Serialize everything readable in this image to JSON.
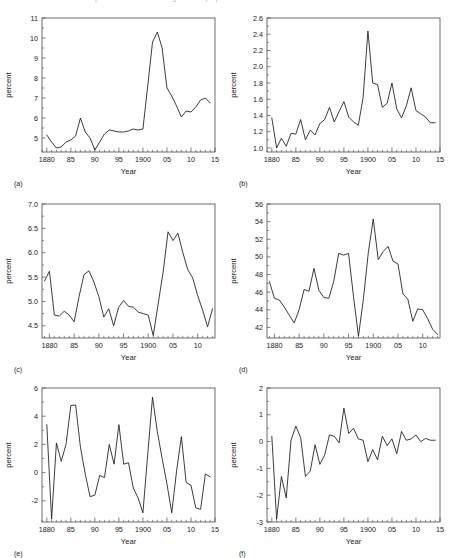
{
  "figure": {
    "width": 450,
    "height": 558,
    "background": "#ffffff",
    "line_color": "#1a1a1a",
    "axis_color": "#4a4a4a",
    "cutoff_top_text": "percent of the foreign-born population",
    "shared_xlabel": "Year",
    "shared_ylabel": "percent"
  },
  "chart_data": [
    {
      "type": "line",
      "panel": "(a)",
      "title": "",
      "xlabel": "Year",
      "ylabel": "percent",
      "xlim": [
        1879,
        1915
      ],
      "ylim": [
        4.3,
        11
      ],
      "yticks": [
        5,
        6,
        7,
        8,
        9,
        10,
        11
      ],
      "ytick_labels": [
        "5",
        "6",
        "7",
        "8",
        "9",
        "10",
        "11"
      ],
      "xticks": [
        1880,
        1885,
        1890,
        1895,
        1900,
        1905,
        1910,
        1915
      ],
      "xtick_labels": [
        "1880",
        "85",
        "90",
        "95",
        "1900",
        "05",
        "10",
        "15"
      ],
      "grid": false,
      "legend": "none",
      "x": [
        1880,
        1881,
        1882,
        1883,
        1884,
        1885,
        1886,
        1887,
        1888,
        1889,
        1890,
        1891,
        1892,
        1893,
        1894,
        1895,
        1896,
        1897,
        1898,
        1899,
        1900,
        1901,
        1902,
        1903,
        1904,
        1905,
        1906,
        1907,
        1908,
        1909,
        1910,
        1911,
        1912,
        1913,
        1914
      ],
      "values": [
        5.15,
        4.8,
        4.5,
        4.55,
        4.8,
        4.9,
        5.1,
        6.0,
        5.3,
        5.0,
        4.4,
        4.8,
        5.2,
        5.4,
        5.35,
        5.3,
        5.3,
        5.35,
        5.45,
        5.4,
        5.45,
        7.6,
        9.8,
        10.3,
        9.5,
        7.5,
        7.1,
        6.6,
        6.05,
        6.35,
        6.3,
        6.55,
        6.9,
        7.0,
        6.75
      ]
    },
    {
      "type": "line",
      "panel": "(b)",
      "title": "",
      "xlabel": "Year",
      "ylabel": "percent",
      "xlim": [
        1879,
        1915
      ],
      "ylim": [
        0.95,
        2.6
      ],
      "yticks": [
        1.0,
        1.2,
        1.4,
        1.6,
        1.8,
        2.0,
        2.2,
        2.4,
        2.6
      ],
      "ytick_labels": [
        "1.0",
        "1.2",
        "1.4",
        "1.6",
        "1.8",
        "2.0",
        "2.2",
        "2.4",
        "2.6"
      ],
      "xticks": [
        1880,
        1885,
        1890,
        1895,
        1900,
        1905,
        1910,
        1915
      ],
      "xtick_labels": [
        "1880",
        "85",
        "90",
        "95",
        "1900",
        "05",
        "10",
        "15"
      ],
      "grid": false,
      "legend": "none",
      "x": [
        1880,
        1881,
        1882,
        1883,
        1884,
        1885,
        1886,
        1887,
        1888,
        1889,
        1890,
        1891,
        1892,
        1893,
        1894,
        1895,
        1896,
        1897,
        1898,
        1899,
        1900,
        1901,
        1902,
        1903,
        1904,
        1905,
        1906,
        1907,
        1908,
        1909,
        1910,
        1911,
        1912,
        1913,
        1914
      ],
      "values": [
        1.37,
        1.0,
        1.12,
        1.02,
        1.18,
        1.17,
        1.35,
        1.1,
        1.22,
        1.16,
        1.3,
        1.35,
        1.5,
        1.32,
        1.45,
        1.57,
        1.38,
        1.32,
        1.28,
        1.62,
        2.44,
        1.8,
        1.78,
        1.5,
        1.55,
        1.8,
        1.48,
        1.37,
        1.52,
        1.74,
        1.46,
        1.42,
        1.38,
        1.31,
        1.31
      ]
    },
    {
      "type": "line",
      "panel": "(c)",
      "title": "",
      "xlabel": "Year",
      "ylabel": "percent",
      "xlim": [
        1878.5,
        1913.5
      ],
      "ylim": [
        4.25,
        7.0
      ],
      "yticks": [
        4.5,
        5.0,
        5.5,
        6.0,
        6.5,
        7.0
      ],
      "ytick_labels": [
        "4.5",
        "5.0",
        "5.5",
        "6.0",
        "6.5",
        "7.0"
      ],
      "xticks": [
        1880,
        1885,
        1890,
        1895,
        1900,
        1905,
        1910
      ],
      "xtick_labels": [
        "1880",
        "85",
        "90",
        "95",
        "1900",
        "05",
        "10"
      ],
      "grid": false,
      "legend": "none",
      "x": [
        1879,
        1880,
        1881,
        1882,
        1883,
        1884,
        1885,
        1886,
        1887,
        1888,
        1889,
        1890,
        1891,
        1892,
        1893,
        1894,
        1895,
        1896,
        1897,
        1898,
        1899,
        1900,
        1901,
        1902,
        1903,
        1904,
        1905,
        1906,
        1907,
        1908,
        1909,
        1910,
        1911,
        1912,
        1913
      ],
      "values": [
        5.42,
        5.62,
        4.72,
        4.7,
        4.8,
        4.72,
        4.58,
        5.1,
        5.55,
        5.63,
        5.4,
        5.1,
        4.68,
        4.85,
        4.5,
        4.88,
        5.02,
        4.9,
        4.88,
        4.78,
        4.75,
        4.72,
        4.3,
        4.95,
        5.6,
        6.43,
        6.25,
        6.4,
        6.0,
        5.65,
        5.48,
        5.12,
        4.82,
        4.48,
        4.85
      ]
    },
    {
      "type": "line",
      "panel": "(d)",
      "title": "",
      "xlabel": "Year",
      "ylabel": "percent",
      "xlim": [
        1878.5,
        1913.5
      ],
      "ylim": [
        40.8,
        56
      ],
      "yticks": [
        42,
        44,
        46,
        48,
        50,
        52,
        54,
        56
      ],
      "ytick_labels": [
        "42",
        "44",
        "46",
        "48",
        "50",
        "52",
        "54",
        "56"
      ],
      "xticks": [
        1880,
        1885,
        1890,
        1895,
        1900,
        1905,
        1910
      ],
      "xtick_labels": [
        "1880",
        "85",
        "90",
        "95",
        "1900",
        "05",
        "10"
      ],
      "grid": false,
      "legend": "none",
      "x": [
        1879,
        1880,
        1881,
        1882,
        1883,
        1884,
        1885,
        1886,
        1887,
        1888,
        1889,
        1890,
        1891,
        1892,
        1893,
        1894,
        1895,
        1896,
        1897,
        1898,
        1899,
        1900,
        1901,
        1902,
        1903,
        1904,
        1905,
        1906,
        1907,
        1908,
        1909,
        1910,
        1911,
        1912,
        1913
      ],
      "values": [
        47.2,
        45.3,
        45.1,
        44.3,
        43.4,
        42.5,
        44.0,
        46.3,
        46.1,
        48.7,
        46.2,
        45.4,
        45.3,
        47.2,
        50.4,
        50.2,
        50.4,
        45.5,
        41.0,
        45.2,
        50.5,
        54.3,
        49.7,
        50.6,
        51.2,
        49.5,
        49.2,
        45.8,
        45.2,
        42.7,
        44.1,
        44.0,
        43.0,
        41.8,
        41.2
      ]
    },
    {
      "type": "line",
      "panel": "(e)",
      "title": "",
      "xlabel": "Year",
      "ylabel": "percent",
      "xlim": [
        1879,
        1915
      ],
      "ylim": [
        -3.5,
        6
      ],
      "yticks": [
        -2,
        0,
        2,
        4,
        6
      ],
      "ytick_labels": [
        "-2",
        "0",
        "2",
        "4",
        "6"
      ],
      "xticks": [
        1880,
        1885,
        1890,
        1895,
        1900,
        1905,
        1910,
        1915
      ],
      "xtick_labels": [
        "1880",
        "85",
        "90",
        "95",
        "1900",
        "05",
        "10",
        "15"
      ],
      "grid": false,
      "legend": "none",
      "x": [
        1880,
        1881,
        1882,
        1883,
        1884,
        1885,
        1886,
        1887,
        1888,
        1889,
        1890,
        1891,
        1892,
        1893,
        1894,
        1895,
        1896,
        1897,
        1898,
        1899,
        1900,
        1901,
        1902,
        1903,
        1904,
        1905,
        1906,
        1907,
        1908,
        1909,
        1910,
        1911,
        1912,
        1913,
        1914
      ],
      "values": [
        3.4,
        -3.3,
        2.1,
        0.8,
        2.0,
        4.75,
        4.8,
        1.8,
        -0.1,
        -1.7,
        -1.6,
        -0.2,
        -0.35,
        2.0,
        0.6,
        3.4,
        0.6,
        0.7,
        -1.1,
        -1.8,
        -2.85,
        1.3,
        5.35,
        2.9,
        1.0,
        -0.8,
        -2.85,
        0.1,
        2.55,
        -0.7,
        -0.9,
        -2.5,
        -2.6,
        -0.1,
        -0.3
      ]
    },
    {
      "type": "line",
      "panel": "(f)",
      "title": "",
      "xlabel": "Year",
      "ylabel": "percent",
      "xlim": [
        1879,
        1915
      ],
      "ylim": [
        -3,
        2
      ],
      "yticks": [
        -3,
        -2,
        -1,
        0,
        1,
        2
      ],
      "ytick_labels": [
        "-3",
        "-2",
        "-1",
        "0",
        "1",
        "2"
      ],
      "xticks": [
        1880,
        1885,
        1890,
        1895,
        1900,
        1905,
        1910,
        1915
      ],
      "xtick_labels": [
        "1880",
        "85",
        "90",
        "95",
        "1900",
        "05",
        "10",
        "15"
      ],
      "grid": false,
      "legend": "none",
      "x": [
        1880,
        1881,
        1882,
        1883,
        1884,
        1885,
        1886,
        1887,
        1888,
        1889,
        1890,
        1891,
        1892,
        1893,
        1894,
        1895,
        1896,
        1897,
        1898,
        1899,
        1900,
        1901,
        1902,
        1903,
        1904,
        1905,
        1906,
        1907,
        1908,
        1909,
        1910,
        1911,
        1912,
        1913,
        1914
      ],
      "values": [
        0.2,
        -2.9,
        -1.3,
        -2.1,
        0.05,
        0.58,
        0.15,
        -1.3,
        -1.1,
        -0.12,
        -0.85,
        -0.5,
        0.25,
        0.2,
        -0.05,
        1.25,
        0.3,
        0.5,
        0.1,
        0.05,
        -0.75,
        -0.3,
        -0.68,
        0.2,
        -0.15,
        0.1,
        -0.45,
        0.38,
        0.05,
        0.1,
        0.25,
        0.0,
        0.12,
        0.05,
        0.05
      ]
    }
  ]
}
